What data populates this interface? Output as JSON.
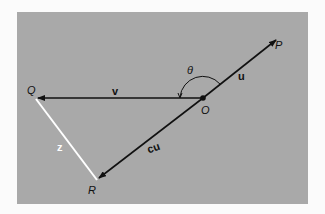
{
  "diagram": {
    "colors": {
      "page_background": "#fbfbfb",
      "panel_background": "#a9a9a9",
      "vector_stroke": "#111111",
      "z_segment": "#ffffff"
    },
    "points": {
      "O": {
        "label": "O",
        "x": 203,
        "y": 98
      },
      "P": {
        "label": "P",
        "x": 276,
        "y": 40
      },
      "Q": {
        "label": "Q",
        "x": 36,
        "y": 98
      },
      "R": {
        "label": "R",
        "x": 97,
        "y": 180
      }
    },
    "vectors": [
      {
        "name": "u",
        "label": "u",
        "from": "O",
        "to": "P"
      },
      {
        "name": "v",
        "label": "v",
        "from": "O",
        "to": "Q"
      },
      {
        "name": "cu",
        "label": "cu",
        "from": "O",
        "to": "R"
      }
    ],
    "segments": [
      {
        "name": "z",
        "label": "z",
        "from": "Q",
        "to": "R",
        "color": "white"
      }
    ],
    "angle": {
      "label": "θ",
      "between": [
        "u",
        "v"
      ],
      "vertex": "O"
    }
  }
}
